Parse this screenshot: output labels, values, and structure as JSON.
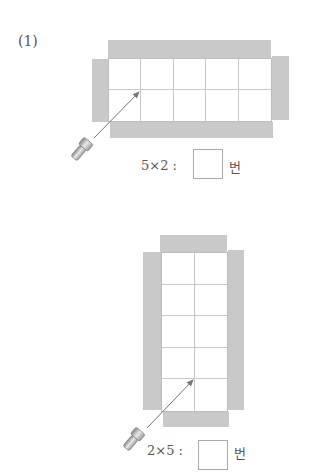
{
  "problem_number": "(1)",
  "figures": [
    {
      "name": "horizontal",
      "grid": {
        "cols": 5,
        "rows": 2
      },
      "expression": "5×2 :",
      "unit": "번",
      "answer": ""
    },
    {
      "name": "vertical",
      "grid": {
        "cols": 2,
        "rows": 5
      },
      "expression": "2×5 :",
      "unit": "번",
      "answer": ""
    }
  ],
  "colors": {
    "flap": "#c9c9c9",
    "grid_line": "#c8c8c8",
    "arrow": "#777777"
  }
}
